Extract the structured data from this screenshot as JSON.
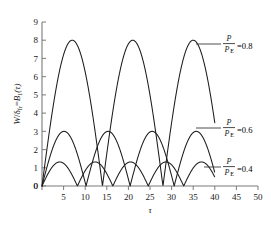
{
  "chart_data": {
    "type": "line",
    "title": "",
    "xlabel": "τ",
    "ylabel": "W/δ_fr = B₁(τ)",
    "xlim": [
      0,
      50
    ],
    "ylim": [
      0,
      9
    ],
    "xticks": [
      0,
      5,
      10,
      15,
      20,
      25,
      30,
      35,
      40,
      45,
      50
    ],
    "yticks": [
      0,
      1,
      2,
      3,
      4,
      5,
      6,
      7,
      8,
      9
    ],
    "grid": false,
    "legend_position": "inline-annotations",
    "series": [
      {
        "name": "P/P_E=0.8",
        "amplitude": 8,
        "period": 14,
        "t_start": 0,
        "t_end": 40,
        "peaks_tau": [
          7,
          21,
          35
        ],
        "zeros_tau": [
          0,
          14,
          28
        ],
        "end_value": 1.8,
        "annotation": {
          "numerator": "P",
          "denominator_main": "P",
          "denominator_sub": "E",
          "value": "=0.8"
        }
      },
      {
        "name": "P/P_E=0.6",
        "amplitude": 3,
        "period": 10.2,
        "t_start": 0,
        "t_end": 40,
        "peaks_tau": [
          4.6,
          14.8,
          25.0,
          35.2
        ],
        "zeros_tau": [
          0,
          10.2,
          20.4,
          30.6,
          40.0
        ],
        "end_value": 0,
        "annotation": {
          "numerator": "P",
          "denominator_main": "P",
          "denominator_sub": "E",
          "value": "=0.6"
        }
      },
      {
        "name": "P/P_E=0.4",
        "amplitude": 1.32,
        "period": 8.2,
        "t_start": 0,
        "t_end": 40,
        "peaks_tau": [
          4.1,
          12.3,
          20.5,
          28.7,
          36.9
        ],
        "zeros_tau": [
          0,
          8.2,
          16.4,
          24.6,
          32.8,
          41.0
        ],
        "end_value": 0,
        "annotation": {
          "numerator": "P",
          "denominator_main": "P",
          "denominator_sub": "E",
          "value": "=0.4"
        }
      }
    ],
    "colors": {
      "curve": "#1c1c1c",
      "axis": "#7a7a7a",
      "text": "#1a1a1a",
      "background": "#ffffff"
    }
  },
  "ylabel_parts": {
    "w": "W",
    "slash": "/",
    "delta": "δ",
    "delta_sub": "fr",
    "equals": "=",
    "b": "B",
    "b_sub": "1",
    "arg": "(τ)"
  },
  "xlabel": "τ",
  "xticklabels": [
    "0",
    "5",
    "10",
    "15",
    "20",
    "25",
    "30",
    "35",
    "40",
    "45",
    "50"
  ],
  "yticklabels": [
    "0",
    "1",
    "2",
    "3",
    "4",
    "5",
    "6",
    "7",
    "8",
    "9"
  ],
  "annotations": [
    {
      "num": "P",
      "den": "P",
      "den_sub": "E",
      "eq": "=0.8"
    },
    {
      "num": "P",
      "den": "P",
      "den_sub": "E",
      "eq": "=0.6"
    },
    {
      "num": "P",
      "den": "P",
      "den_sub": "E",
      "eq": "=0.4"
    }
  ]
}
